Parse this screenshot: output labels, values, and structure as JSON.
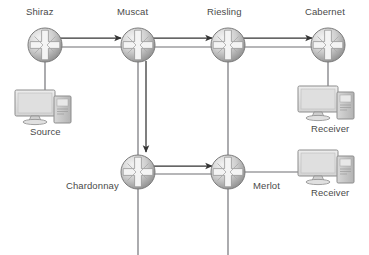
{
  "diagram": {
    "type": "network-topology",
    "colors": {
      "line": "#6e6e73",
      "arrow": "#333333",
      "label_text": "#4a4a4a",
      "router_body_light": "#e8e8e8",
      "router_body_dark": "#9a9a9a",
      "router_outline": "#7a7a7a",
      "pc_screen": "#e2e2e2",
      "pc_case": "#c9c9c9",
      "background": "#ffffff"
    },
    "routers": [
      {
        "id": "shiraz",
        "label": "Shiraz",
        "x": 45,
        "y": 45,
        "label_x": 26,
        "label_y": 6
      },
      {
        "id": "muscat",
        "label": "Muscat",
        "x": 138,
        "y": 45,
        "label_x": 117,
        "label_y": 6
      },
      {
        "id": "riesling",
        "label": "Riesling",
        "x": 228,
        "y": 45,
        "label_x": 207,
        "label_y": 6
      },
      {
        "id": "cabernet",
        "label": "Cabernet",
        "x": 328,
        "y": 45,
        "label_x": 305,
        "label_y": 6
      },
      {
        "id": "chardonnay",
        "label": "Chardonnay",
        "x": 138,
        "y": 172,
        "label_x": 66,
        "label_y": 180
      },
      {
        "id": "merlot",
        "label": "Merlot",
        "x": 228,
        "y": 172,
        "label_x": 253,
        "label_y": 180
      }
    ],
    "hosts": [
      {
        "id": "source",
        "label": "Source",
        "x": 14,
        "y": 88,
        "label_x": 30,
        "label_y": 126
      },
      {
        "id": "receiver-1",
        "label": "Receiver",
        "x": 297,
        "y": 84,
        "label_x": 311,
        "label_y": 123
      },
      {
        "id": "receiver-2",
        "label": "Receiver",
        "x": 297,
        "y": 148,
        "label_x": 311,
        "label_y": 187
      }
    ],
    "links": [
      {
        "id": "shiraz-muscat",
        "from": "Shiraz",
        "to": "Muscat"
      },
      {
        "id": "muscat-riesling",
        "from": "Muscat",
        "to": "Riesling"
      },
      {
        "id": "riesling-cabernet",
        "from": "Riesling",
        "to": "Cabernet"
      },
      {
        "id": "muscat-chardonnay",
        "from": "Muscat",
        "to": "Chardonnay"
      },
      {
        "id": "riesling-merlot",
        "from": "Riesling",
        "to": "Merlot"
      },
      {
        "id": "chardonnay-merlot",
        "from": "Chardonnay",
        "to": "Merlot"
      },
      {
        "id": "shiraz-source",
        "from": "Shiraz",
        "to": "Source"
      },
      {
        "id": "cabernet-receiver-1",
        "from": "Cabernet",
        "to": "Receiver"
      },
      {
        "id": "merlot-receiver-2",
        "from": "Merlot",
        "to": "Receiver"
      },
      {
        "id": "chardonnay-downlink",
        "from": "Chardonnay",
        "to": ""
      },
      {
        "id": "merlot-downlink",
        "from": "Merlot",
        "to": ""
      }
    ],
    "flow_arrows": [
      {
        "id": "arrow-shiraz-muscat",
        "from": "Shiraz",
        "to": "Muscat",
        "direction": "right"
      },
      {
        "id": "arrow-muscat-riesling",
        "from": "Muscat",
        "to": "Riesling",
        "direction": "right"
      },
      {
        "id": "arrow-riesling-cabernet",
        "from": "Riesling",
        "to": "Cabernet",
        "direction": "right"
      },
      {
        "id": "arrow-muscat-chardonnay",
        "from": "Muscat",
        "to": "Chardonnay",
        "direction": "down"
      },
      {
        "id": "arrow-chardonnay-merlot",
        "from": "Chardonnay",
        "to": "Merlot",
        "direction": "right"
      }
    ]
  }
}
